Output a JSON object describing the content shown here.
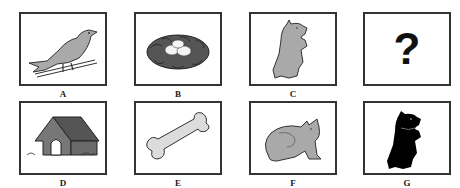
{
  "panels": [
    {
      "label": "A",
      "content": "bird-on-wire"
    },
    {
      "label": "B",
      "content": "nest-with-eggs"
    },
    {
      "label": "C",
      "content": "gray-dog-sitting"
    },
    {
      "label": "?",
      "content": "question-mark",
      "symbol": "?"
    },
    {
      "label": "D",
      "content": "doghouse"
    },
    {
      "label": "E",
      "content": "bone"
    },
    {
      "label": "F",
      "content": "cat-sitting"
    },
    {
      "label": "G",
      "content": "black-dog-sitting"
    }
  ],
  "question_symbol": "?",
  "colors": {
    "gray_fill": "#a9a9a9",
    "dark_fill": "#555555",
    "light_fill": "#dcdcdc",
    "black_fill": "#000000",
    "border": "#333333"
  }
}
